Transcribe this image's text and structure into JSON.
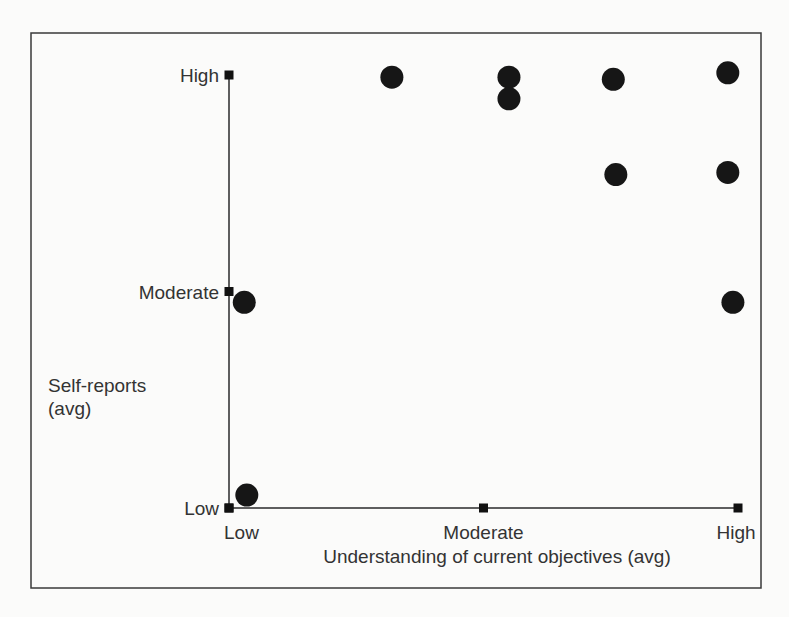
{
  "chart_data": {
    "type": "scatter",
    "title": "",
    "xlabel": "Understanding of current objectives (avg)",
    "ylabel": [
      "Self-reports",
      "(avg)"
    ],
    "x_ticks": [
      {
        "value": 0,
        "label": "Low"
      },
      {
        "value": 1,
        "label": "Moderate"
      },
      {
        "value": 2,
        "label": "High"
      }
    ],
    "y_ticks": [
      {
        "value": 0,
        "label": "Low"
      },
      {
        "value": 1,
        "label": "Moderate"
      },
      {
        "value": 2,
        "label": "High"
      }
    ],
    "xlim": [
      0,
      2
    ],
    "ylim": [
      0,
      2
    ],
    "grid": false,
    "legend": null,
    "points": [
      {
        "x": 0.64,
        "y": 1.99
      },
      {
        "x": 1.1,
        "y": 1.99
      },
      {
        "x": 1.1,
        "y": 1.89
      },
      {
        "x": 1.51,
        "y": 1.98
      },
      {
        "x": 1.96,
        "y": 2.01
      },
      {
        "x": 1.52,
        "y": 1.54
      },
      {
        "x": 1.96,
        "y": 1.55
      },
      {
        "x": 0.06,
        "y": 0.95
      },
      {
        "x": 1.98,
        "y": 0.95
      },
      {
        "x": 0.07,
        "y": 0.06
      }
    ],
    "colors": {
      "marker": "#161616",
      "axis": "#2a2a2a",
      "frame": "#3a3a3a"
    }
  }
}
